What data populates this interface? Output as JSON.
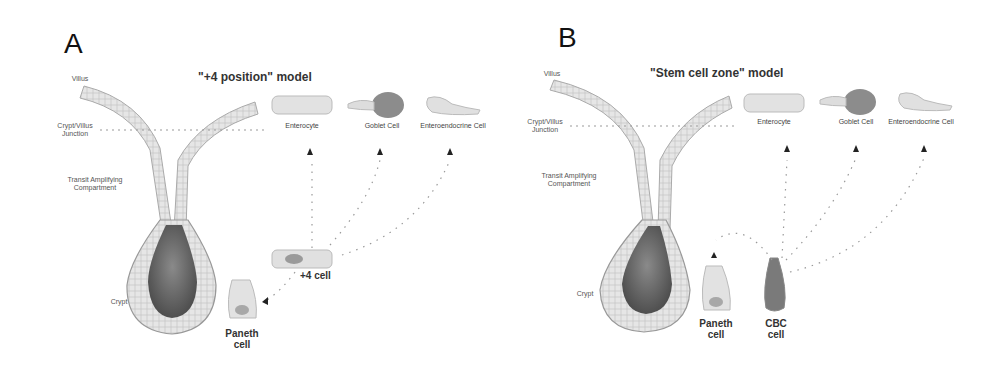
{
  "figure": {
    "panels": [
      {
        "letter": "A",
        "title": "\"+4 position\" model",
        "zones": {
          "villus": "Villus",
          "junction": "Crypt/Villus Junction",
          "transit": "Transit Amplifying Compartment",
          "crypt": "Crypt"
        },
        "differentiated_cells": {
          "enterocyte": "Enterocyte",
          "goblet": "Goblet Cell",
          "enteroendocrine": "Enteroendocrine Cell"
        },
        "stem_cell": "+4 cell",
        "paneth": "Paneth cell"
      },
      {
        "letter": "B",
        "title": "\"Stem cell zone\" model",
        "zones": {
          "villus": "Villus",
          "junction": "Crypt/Villus Junction",
          "transit": "Transit Amplifying Compartment",
          "crypt": "Crypt"
        },
        "differentiated_cells": {
          "enterocyte": "Enterocyte",
          "goblet": "Goblet Cell",
          "enteroendocrine": "Enteroendocrine Cell"
        },
        "stem_cell": "CBC cell",
        "paneth": "Paneth cell"
      }
    ],
    "colors": {
      "epithelium": "#e4e4e4",
      "lumen": "#6e6e6e",
      "outline": "#9a9a9a",
      "dots": "#9a9a9a"
    }
  }
}
